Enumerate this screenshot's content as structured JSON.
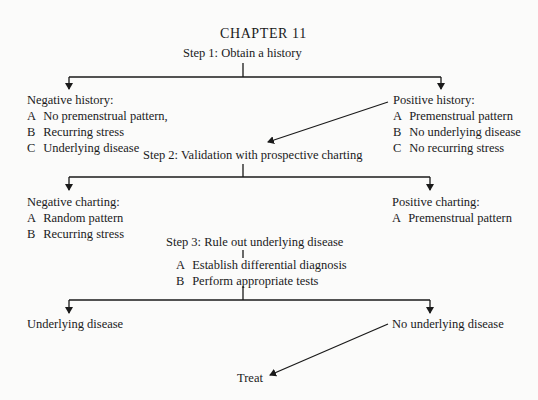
{
  "header": {
    "chapter": "CHAPTER 11"
  },
  "step1": {
    "title": "Step 1: Obtain a history",
    "negative": {
      "heading": "Negative history:",
      "items": [
        {
          "key": "A",
          "text": "No premenstrual pattern,"
        },
        {
          "key": "B",
          "text": "Recurring stress"
        },
        {
          "key": "C",
          "text": "Underlying disease"
        }
      ]
    },
    "positive": {
      "heading": "Positive history:",
      "items": [
        {
          "key": "A",
          "text": "Premenstrual pattern"
        },
        {
          "key": "B",
          "text": "No underlying disease"
        },
        {
          "key": "C",
          "text": "No recurring stress"
        }
      ]
    }
  },
  "step2": {
    "title": "Step 2: Validation  with prospective charting",
    "negative": {
      "heading": "Negative charting:",
      "items": [
        {
          "key": "A",
          "text": "Random pattern"
        },
        {
          "key": "B",
          "text": "Recurring stress"
        }
      ]
    },
    "positive": {
      "heading": "Positive charting:",
      "items": [
        {
          "key": "A",
          "text": "Premenstrual pattern"
        }
      ]
    }
  },
  "step3": {
    "title": "Step 3: Rule out underlying disease",
    "items": [
      {
        "key": "A",
        "text": "Establish differential diagnosis"
      },
      {
        "key": "B",
        "text": "Perform appropriate tests"
      }
    ],
    "outcome_negative": "Underlying disease",
    "outcome_positive": "No underlying disease"
  },
  "final": {
    "label": "Treat"
  },
  "colors": {
    "ink": "#1a1a1a",
    "paper": "#fbfbfa"
  }
}
